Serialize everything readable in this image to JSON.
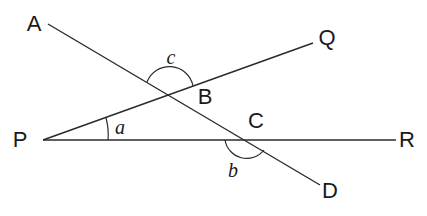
{
  "diagram": {
    "type": "geometry",
    "stroke_color": "#2a2a2a",
    "points": {
      "A": {
        "label": "A",
        "x": 34,
        "y": 24
      },
      "B": {
        "label": "B",
        "x": 205,
        "y": 97
      },
      "C": {
        "label": "C",
        "x": 256,
        "y": 121
      },
      "D": {
        "label": "D",
        "x": 330,
        "y": 191
      },
      "P": {
        "label": "P",
        "x": 20,
        "y": 140
      },
      "Q": {
        "label": "Q",
        "x": 327,
        "y": 38
      },
      "R": {
        "label": "R",
        "x": 407,
        "y": 140
      }
    },
    "angles": {
      "a": {
        "label": "a",
        "x": 120,
        "y": 127
      },
      "b": {
        "label": "b",
        "x": 233,
        "y": 170
      },
      "c": {
        "label": "c",
        "x": 171,
        "y": 57
      }
    },
    "lines": [
      {
        "name": "AD",
        "x1": 48,
        "y1": 24,
        "x2": 320,
        "y2": 185
      },
      {
        "name": "PQ",
        "x1": 43,
        "y1": 140,
        "x2": 313,
        "y2": 43
      },
      {
        "name": "PR",
        "x1": 43,
        "y1": 140,
        "x2": 396,
        "y2": 140
      }
    ]
  }
}
